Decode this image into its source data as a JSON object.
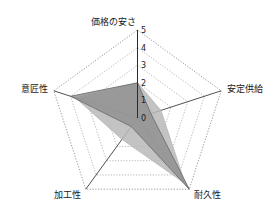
{
  "chart_data": {
    "type": "radar",
    "title": "",
    "subtitle": "",
    "xlabel": "",
    "ylabel": "",
    "categories": [
      "価格の安さ",
      "安定供給",
      "耐久性",
      "加工性",
      "意匠性"
    ],
    "tick_labels": [
      "0",
      "1",
      "2",
      "3",
      "4",
      "5"
    ],
    "ylim": [
      0,
      5
    ],
    "grid": true,
    "grid_style": "dotted",
    "legend": "none",
    "series": [
      {
        "name": "series-1",
        "color": "#8f8f8f",
        "values": [
          2.0,
          0.8,
          5.0,
          0.6,
          4.0
        ]
      },
      {
        "name": "series-2",
        "color": "#b9b9b9",
        "values": [
          2.0,
          1.4,
          4.6,
          1.5,
          3.7
        ]
      }
    ]
  },
  "labels": {
    "top": "価格の安さ",
    "right": "安定供給",
    "bottom_right": "耐久性",
    "bottom_left": "加工性",
    "left": "意匠性"
  },
  "ticks": {
    "t5": "5",
    "t4": "4",
    "t3": "3",
    "t2": "2",
    "t1": "1",
    "t0": "0"
  },
  "colors": {
    "background": "#ffffff",
    "grid": "#9a9a9a",
    "spoke": "#3c3c3c",
    "text": "#1a1a1a",
    "series_dark": "#8f8f8f",
    "series_light": "#b9b9b9"
  }
}
